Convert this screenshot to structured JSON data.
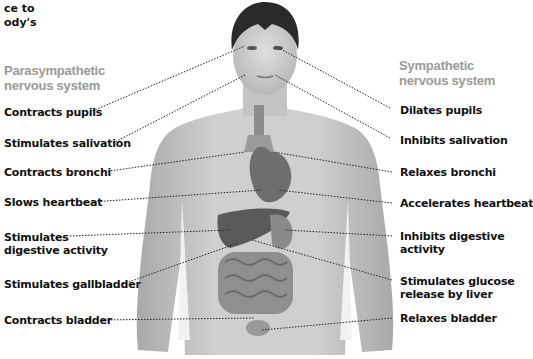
{
  "intro_fragment": [
    "ce to",
    "ody's"
  ],
  "parasympathetic": {
    "heading": [
      "Parasympathetic",
      "nervous system"
    ],
    "effects": [
      {
        "lines": [
          "Contracts pupils"
        ]
      },
      {
        "lines": [
          "Stimulates salivation"
        ]
      },
      {
        "lines": [
          "Contracts bronchi"
        ]
      },
      {
        "lines": [
          "Slows heartbeat"
        ]
      },
      {
        "lines": [
          "Stimulates",
          "digestive activity"
        ]
      },
      {
        "lines": [
          "Stimulates gallbladder"
        ]
      },
      {
        "lines": [
          "Contracts bladder"
        ]
      }
    ]
  },
  "sympathetic": {
    "heading": [
      "Sympathetic",
      "nervous system"
    ],
    "effects": [
      {
        "lines": [
          "Dilates pupils"
        ]
      },
      {
        "lines": [
          "Inhibits salivation"
        ]
      },
      {
        "lines": [
          "Relaxes bronchi"
        ]
      },
      {
        "lines": [
          "Accelerates heartbeat"
        ]
      },
      {
        "lines": [
          "Inhibits digestive",
          "activity"
        ]
      },
      {
        "lines": [
          "Stimulates glucose",
          "release by liver"
        ]
      },
      {
        "lines": [
          "Relaxes bladder"
        ]
      }
    ]
  },
  "colors": {
    "heading_gray": "#9a9a9a",
    "label_text": "#111111",
    "skin": "#c8c8c8",
    "hair": "#2a2a2a",
    "organ": "#7a7a7a",
    "leader_line": "#222222"
  }
}
